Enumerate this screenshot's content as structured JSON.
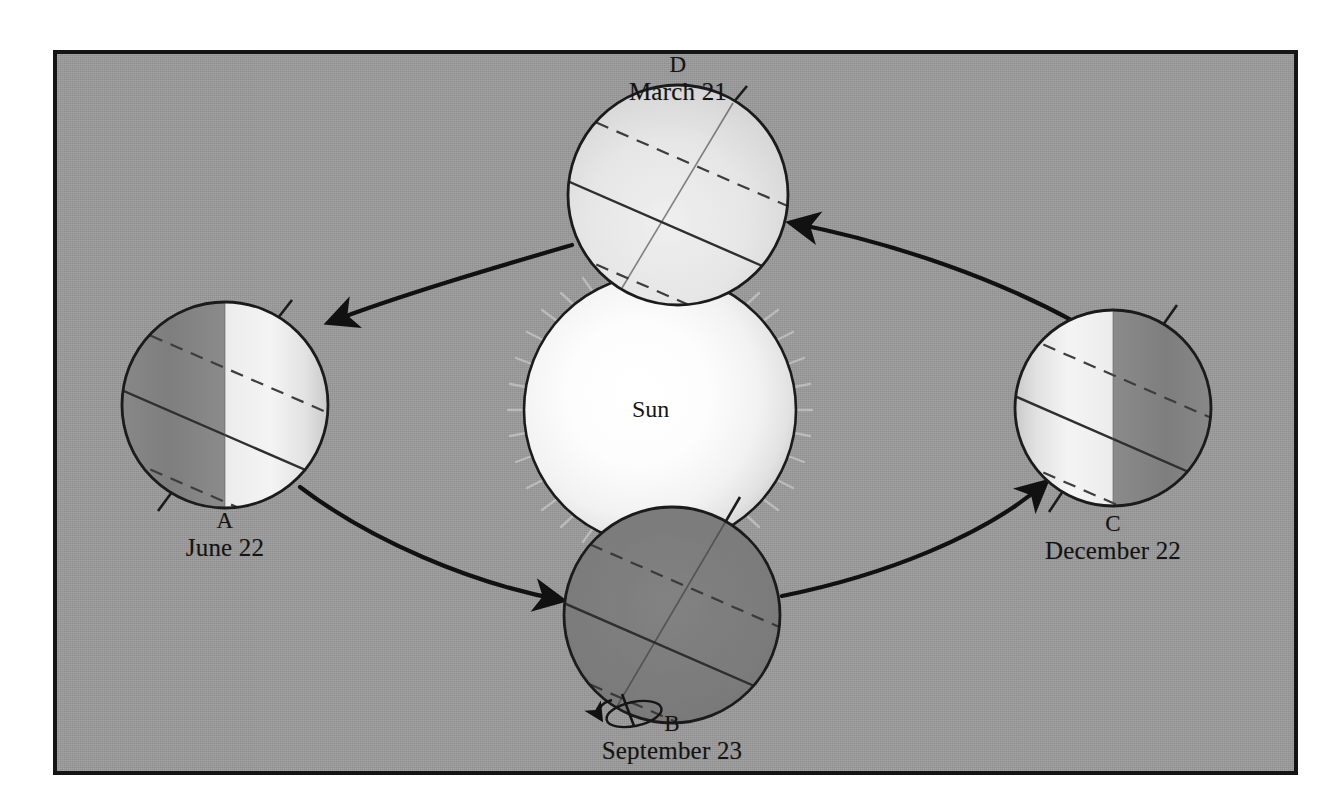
{
  "figure": {
    "background_color": "#9c9c9c",
    "frame_color": "#141414",
    "sun_label": "Sun",
    "orbit_direction": "counterclockwise"
  },
  "sun": {
    "label": "Sun",
    "center_x": 660,
    "center_y": 410,
    "radius": 136,
    "core_color": "#ffffff",
    "edge_color": "#d8d8d8",
    "outline_color": "#1b1b1b"
  },
  "positions": [
    {
      "id": "A",
      "date": "June 22",
      "center_x": 225,
      "center_y": 405,
      "radius": 103,
      "lit_side": "right",
      "dark_side": "left",
      "fully_lit": false,
      "fully_dark": false,
      "label_x": 225,
      "label_y": 513,
      "axis_tilt_deg": 23.5,
      "has_rotation_arrow": false
    },
    {
      "id": "B",
      "date": "September 23",
      "center_x": 672,
      "center_y": 615,
      "radius": 108,
      "lit_side": "none",
      "dark_side": "all",
      "fully_lit": false,
      "fully_dark": true,
      "label_x": 672,
      "label_y": 716,
      "axis_tilt_deg": 23.5,
      "has_rotation_arrow": true
    },
    {
      "id": "C",
      "date": "December 22",
      "center_x": 1113,
      "center_y": 408,
      "radius": 98,
      "lit_side": "left",
      "dark_side": "right",
      "fully_lit": false,
      "fully_dark": false,
      "label_x": 1113,
      "label_y": 516,
      "axis_tilt_deg": 23.5,
      "has_rotation_arrow": false
    },
    {
      "id": "D",
      "date": "March 21",
      "center_x": 678,
      "center_y": 195,
      "radius": 110,
      "lit_side": "all",
      "dark_side": "none",
      "fully_lit": true,
      "fully_dark": false,
      "label_x": 678,
      "label_y": 57,
      "axis_tilt_deg": 23.5,
      "has_rotation_arrow": false
    }
  ],
  "earth_colors": {
    "lit": "#e3e3e3",
    "dark": "#808080",
    "outline": "#1b1b1b",
    "equator": "#2b2b2b",
    "tropic": "#3a3a3a"
  },
  "orbit": {
    "stroke_color": "#111111",
    "stroke_width": 4,
    "segments": [
      {
        "from": "D",
        "to": "A",
        "arrow_at": "A"
      },
      {
        "from": "A",
        "to": "B",
        "arrow_at": "B"
      },
      {
        "from": "B",
        "to": "C",
        "arrow_at": "C"
      },
      {
        "from": "C",
        "to": "D",
        "arrow_at": "D"
      }
    ]
  },
  "labels": {
    "a_id": "A",
    "a_date": "June 22",
    "b_id": "B",
    "b_date": "September 23",
    "c_id": "C",
    "c_date": "December 22",
    "d_id": "D",
    "d_date": "March 21",
    "sun": "Sun"
  }
}
